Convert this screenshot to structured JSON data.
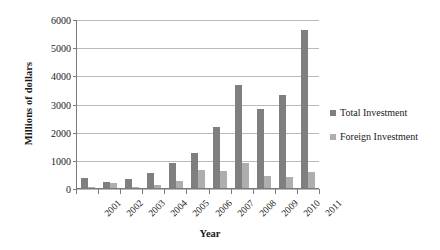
{
  "chart_data": {
    "type": "bar",
    "title": "",
    "xlabel": "Year",
    "ylabel": "Millions of dollars",
    "categories": [
      "2001",
      "2002",
      "2003",
      "2004",
      "2005",
      "2006",
      "2007",
      "2008",
      "2009",
      "2010",
      "2011"
    ],
    "series": [
      {
        "name": "Total Investment",
        "color": "#7f7f7f",
        "values": [
          350,
          210,
          320,
          550,
          880,
          1230,
          2150,
          3660,
          2800,
          3300,
          5600
        ]
      },
      {
        "name": "Foreign Investment",
        "color": "#aeaeae",
        "values": [
          40,
          190,
          40,
          90,
          250,
          640,
          620,
          900,
          440,
          400,
          560
        ]
      }
    ],
    "ylim": [
      0,
      6000
    ],
    "yticks": [
      0,
      1000,
      2000,
      3000,
      4000,
      5000,
      6000
    ],
    "ytick_labels": [
      "0",
      "1000",
      "2000",
      "3000",
      "4000",
      "5000",
      "6000"
    ],
    "grid": true,
    "legend_position": "right"
  },
  "legend": {
    "entries": [
      {
        "label": "Total Investment"
      },
      {
        "label": "Foreign Investment"
      }
    ]
  }
}
